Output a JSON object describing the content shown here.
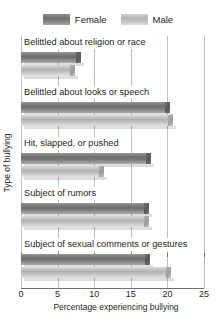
{
  "chart_data": {
    "type": "bar",
    "orientation": "horizontal",
    "title": "",
    "xlabel": "Percentage experiencing bullying",
    "ylabel": "Type of bullying",
    "xlim": [
      0,
      25
    ],
    "xticks": [
      0,
      5,
      10,
      15,
      20,
      25
    ],
    "xtick_labels": [
      "0",
      "5",
      "10",
      "15",
      "20",
      "25"
    ],
    "grid": true,
    "legend_position": "top-center",
    "categories": [
      "Belittled about religion or race",
      "Belittled about looks or speech",
      "Hit, slapped, or pushed",
      "Subject of rumors",
      "Subject of sexual comments or gestures"
    ],
    "series": [
      {
        "name": "Female",
        "color": "#7d7d7d",
        "values": [
          8.2,
          20.3,
          17.8,
          17.5,
          17.6
        ]
      },
      {
        "name": "Male",
        "color": "#c0c0c0",
        "values": [
          7.4,
          20.7,
          11.3,
          17.5,
          20.5
        ]
      }
    ]
  },
  "legend": {
    "entries": [
      {
        "label": "Female",
        "swatch": "female-swatch"
      },
      {
        "label": "Male",
        "swatch": "male-swatch"
      }
    ]
  }
}
